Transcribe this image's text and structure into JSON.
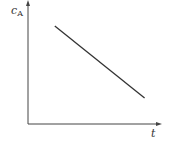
{
  "chart_data": {
    "type": "line",
    "title": "",
    "xlabel": "t",
    "ylabel": "c_A",
    "ylabel_main": "c",
    "ylabel_sub": "A",
    "grid": false,
    "legend": null,
    "ticks": false,
    "series": [
      {
        "name": "c_A vs t",
        "x": [
          0.2,
          0.87
        ],
        "y": [
          0.79,
          0.21
        ],
        "color": "#333333"
      }
    ],
    "xlim": [
      0,
      1
    ],
    "ylim": [
      0,
      1
    ]
  }
}
